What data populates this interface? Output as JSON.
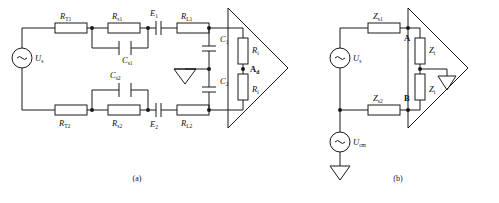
{
  "figure": {
    "caption_a": "(a)",
    "caption_b": "(b)"
  },
  "circuit_a": {
    "source": {
      "symbol": "~",
      "label": "U",
      "sub": "s"
    },
    "components": {
      "r_t1": {
        "label": "R",
        "sub": "T1"
      },
      "r_t2": {
        "label": "R",
        "sub": "T2"
      },
      "r_s1": {
        "label": "R",
        "sub": "s1"
      },
      "r_s2": {
        "label": "R",
        "sub": "s2"
      },
      "c_s1": {
        "label": "C",
        "sub": "s1"
      },
      "c_s2": {
        "label": "C",
        "sub": "s2"
      },
      "e1": {
        "label": "E",
        "sub": "1"
      },
      "e2": {
        "label": "E",
        "sub": "2"
      },
      "r_l1": {
        "label": "R",
        "sub": "L1"
      },
      "r_l2": {
        "label": "R",
        "sub": "L2"
      },
      "c1": {
        "label": "C",
        "sub": "1"
      },
      "c2": {
        "label": "C",
        "sub": "2"
      },
      "r_i_top": {
        "label": "R",
        "sub": "i"
      },
      "r_i_bot": {
        "label": "R",
        "sub": "i"
      }
    },
    "node_ad": {
      "label": "A",
      "sub": "d"
    }
  },
  "circuit_b": {
    "source_signal": {
      "symbol": "~",
      "label": "U",
      "sub": "s"
    },
    "source_cm": {
      "symbol": "~",
      "label": "U",
      "sub": "cm"
    },
    "components": {
      "z_s1": {
        "label": "Z",
        "sub": "s1"
      },
      "z_s2": {
        "label": "Z",
        "sub": "s2"
      },
      "z_i_top": {
        "label": "Z",
        "sub": "i"
      },
      "z_i_bot": {
        "label": "Z",
        "sub": "i"
      }
    },
    "nodes": {
      "a": "A",
      "b": "B"
    }
  },
  "colors": {
    "line": "#1a1a1a",
    "background": "#ffffff",
    "text": "#111111"
  }
}
